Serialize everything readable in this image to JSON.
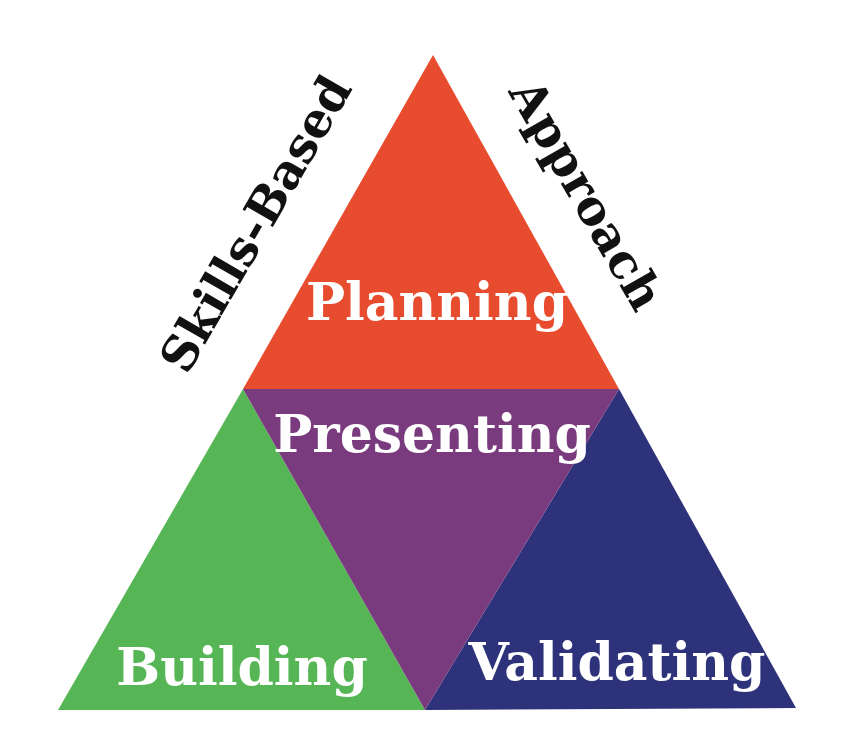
{
  "diagram": {
    "type": "triangle-framework",
    "side_labels": {
      "left": "Skills-Based",
      "right": "Approach"
    },
    "sections": {
      "top": {
        "label": "Planning",
        "color": "#E84C2E"
      },
      "center": {
        "label": "Presenting",
        "color": "#7A3B7E"
      },
      "bottom_left": {
        "label": "Building",
        "color": "#56B655"
      },
      "bottom_right": {
        "label": "Validating",
        "color": "#2E327A"
      }
    }
  }
}
